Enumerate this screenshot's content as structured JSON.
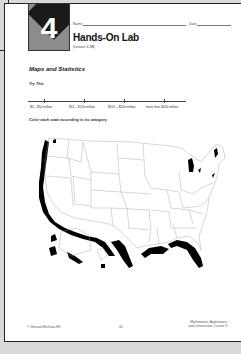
{
  "worksheet": {
    "chapter_number": "4",
    "name_label": "Name",
    "date_label": "Date",
    "title": "Hands-On Lab",
    "lesson": "(Lesson 4-3B)",
    "section_title": "Maps and Statistics",
    "try_this": "Try This",
    "number_line": {
      "labels": [
        "$0 – $50 million",
        "$51 – $100 million",
        "$101 – $200 million",
        "more than $200 million"
      ]
    },
    "instruction": "Color each state according to its category.",
    "map": {
      "subject": "United States map with state outlines",
      "coastline_color": "#000000"
    },
    "footer": {
      "copyright": "© Glencoe/McGraw-Hill",
      "page_number": "40",
      "book_line1": "Mathematics: Applications",
      "book_line2": "and Connections, Course 3"
    }
  },
  "colors": {
    "background": "#d9d9d9",
    "page": "#ffffff",
    "badge_gray": "#8c8c8c",
    "badge_dark": "#1a1a1a"
  }
}
